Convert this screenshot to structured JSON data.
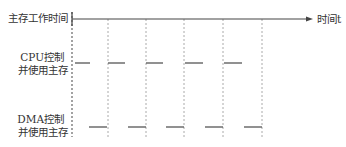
{
  "labels": {
    "memory_time": "主存工作时间",
    "time_axis": "时间t",
    "cpu_line1": "CPU控制",
    "cpu_line2": "并使用主存",
    "dma_line1": "DMA控制",
    "dma_line2": "并使用主存"
  },
  "axis": {
    "x_start": 72,
    "x_end": 313,
    "y": 19
  },
  "cycle_boundaries_x": [
    72,
    108,
    146,
    184,
    223,
    262
  ],
  "cpu_segments": [
    [
      75,
      90
    ],
    [
      108,
      125
    ],
    [
      146,
      163
    ],
    [
      185,
      203
    ],
    [
      224,
      242
    ]
  ],
  "cpu_y": 63,
  "dma_segments": [
    [
      89,
      107
    ],
    [
      128,
      146
    ],
    [
      166,
      184
    ],
    [
      205,
      223
    ],
    [
      244,
      262
    ]
  ],
  "dma_y": 127,
  "colors": {
    "line": "#555555",
    "dash": "#aaaaaa"
  }
}
